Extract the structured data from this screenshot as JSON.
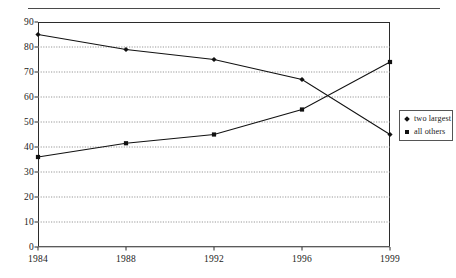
{
  "chart_data": {
    "type": "line",
    "title": "",
    "subtitle": "",
    "xlabel": "",
    "ylabel": "",
    "categories": [
      "1984",
      "1988",
      "1992",
      "1996",
      "1999"
    ],
    "series": [
      {
        "name": "two largest",
        "marker": "diamond",
        "color": "#111111",
        "values": [
          85,
          79,
          75,
          67,
          45
        ]
      },
      {
        "name": "all others",
        "marker": "square",
        "color": "#111111",
        "values": [
          36,
          41.5,
          45,
          55,
          74
        ]
      }
    ],
    "ylim": [
      0,
      90
    ],
    "yticks": [
      0,
      10,
      20,
      30,
      40,
      50,
      60,
      70,
      80,
      90
    ],
    "ytick_labels": [
      "0",
      "10",
      "20",
      "30",
      "40",
      "50",
      "60",
      "70",
      "80",
      "90"
    ],
    "xtick_labels": [
      "1984",
      "1988",
      "1992",
      "1996",
      "1999"
    ],
    "grid": "horizontal-dotted",
    "legend_position": "right-outside",
    "annotations": []
  },
  "legend": {
    "entries": [
      {
        "label": "two largest",
        "marker_name": "diamond-marker"
      },
      {
        "label": "all others",
        "marker_name": "square-marker"
      }
    ]
  },
  "colors": {
    "line": "#111111",
    "frame": "#2b2b2b",
    "grid": "#8d8d8d",
    "rule": "#4a4a4a",
    "text": "#1a1a1a",
    "background": "#ffffff"
  }
}
